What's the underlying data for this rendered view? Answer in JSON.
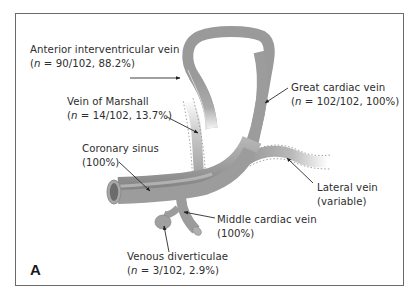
{
  "figure": {
    "panel_label": "A",
    "colors": {
      "vein_fill": "#9c9c9c",
      "vein_dark": "#7d7d7d",
      "vein_light": "#c4c4c4",
      "frame": "#6a6a6a",
      "text": "#2e2e2e"
    }
  },
  "labels": {
    "aiv": {
      "name": "Anterior interventricular vein",
      "prefix": "(",
      "n": "n",
      "stat": " = 90/102, 88.2%)"
    },
    "gcv": {
      "name": "Great cardiac vein",
      "prefix": "(",
      "n": "n",
      "stat": " = 102/102, 100%)"
    },
    "vom": {
      "name": "Vein of Marshall",
      "prefix": "(",
      "n": "n",
      "stat": " = 14/102, 13.7%)"
    },
    "cs": {
      "name": "Coronary sinus",
      "stat": "(100%)"
    },
    "lat": {
      "name": "Lateral vein",
      "stat": "(variable)"
    },
    "mcv": {
      "name": "Middle cardiac vein",
      "stat": "(100%)"
    },
    "vd": {
      "name": "Venous diverticulae",
      "prefix": "(",
      "n": "n",
      "stat": " = 3/102, 2.9%)"
    }
  }
}
